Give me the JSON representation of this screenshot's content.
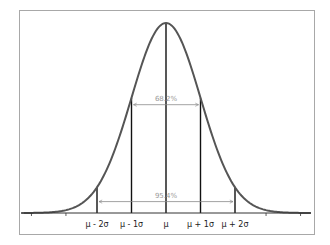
{
  "chart_data": {
    "type": "line",
    "title": "",
    "xlabel": "",
    "ylabel": "",
    "distribution": "normal",
    "mean": 0,
    "sd": 1,
    "xlim": [
      -4.2,
      4.2
    ],
    "grid": false,
    "legend": "none",
    "tick_labels": [
      {
        "x": -2,
        "label": "μ - 2σ"
      },
      {
        "x": -1,
        "label": "μ - 1σ"
      },
      {
        "x": 0,
        "label": "μ"
      },
      {
        "x": 1,
        "label": "μ + 1σ"
      },
      {
        "x": 2,
        "label": "μ + 2σ"
      }
    ],
    "minor_ticks": [
      -3.9,
      -2.9,
      2.9,
      3.9
    ],
    "vertical_lines": [
      -2,
      -1,
      0,
      1,
      2
    ],
    "annotations": [
      {
        "label": "68.2%",
        "from": -1,
        "to": 1,
        "level": 0.57
      },
      {
        "label": "95.4%",
        "from": -2,
        "to": 2,
        "level": 0.06
      }
    ]
  },
  "colors": {
    "curve": "#555555",
    "axis": "#333333",
    "sigma_lines": "#111111",
    "arrows": "#8a8a8a",
    "frame": "#a8a8a8"
  }
}
